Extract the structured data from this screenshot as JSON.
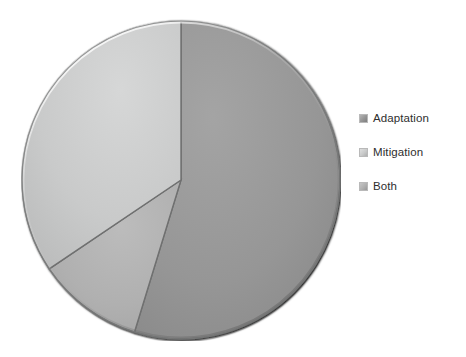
{
  "chart_data": {
    "type": "pie",
    "title": "",
    "subtitle": "",
    "xlabel": "",
    "ylabel": "",
    "grid": false,
    "legend_position": "right",
    "start_angle_deg": 0,
    "direction": "clockwise",
    "categories": [
      "Adaptation",
      "Mitigation",
      "Both"
    ],
    "values": [
      55,
      34,
      11
    ],
    "unit": "%",
    "slices": [
      {
        "label": "Adaptation",
        "value": 55,
        "percent": 55,
        "color": "#949494",
        "start_angle_deg": 0,
        "end_angle_deg": 197
      },
      {
        "label": "Both",
        "value": 11,
        "percent": 11,
        "color": "#b0b0b0",
        "start_angle_deg": 197,
        "end_angle_deg": 236
      },
      {
        "label": "Mitigation",
        "value": 34,
        "percent": 34,
        "color": "#c9cacA",
        "start_angle_deg": 236,
        "end_angle_deg": 360
      }
    ],
    "annotations": []
  },
  "legend": {
    "items": [
      {
        "label": "Adaptation",
        "color": "#949494",
        "swatch_name": "legend-swatch-adaptation"
      },
      {
        "label": "Mitigation",
        "color": "#c9caca",
        "swatch_name": "legend-swatch-mitigation"
      },
      {
        "label": "Both",
        "color": "#b0b0b0",
        "swatch_name": "legend-swatch-both"
      }
    ]
  },
  "colors": {
    "background": "#ffffff",
    "slice_adaptation": "#949494",
    "slice_mitigation": "#c9caca",
    "slice_both": "#b0b0b0",
    "slice_edge": "#6f7070",
    "legend_text": "#2e2e2e"
  }
}
